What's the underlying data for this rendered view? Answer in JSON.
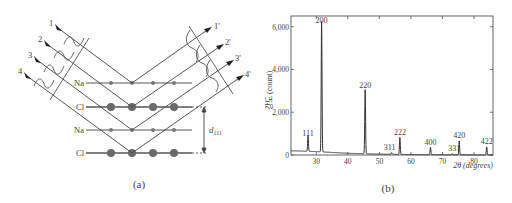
{
  "panel_a": {
    "caption": "(a)",
    "incident_rays": [
      "1",
      "2",
      "3",
      "4"
    ],
    "reflected_rays": [
      "1'",
      "2'",
      "3'",
      "4'"
    ],
    "planes": [
      {
        "label": "Na",
        "atom": "small"
      },
      {
        "label": "Cl",
        "atom": "large"
      },
      {
        "label": "Na",
        "atom": "small"
      },
      {
        "label": "Cl",
        "atom": "large"
      }
    ],
    "spacing_label": "d",
    "spacing_subscript": "111"
  },
  "panel_b": {
    "caption": "(b)",
    "ylabel": "강도 (count)",
    "xlabel": "2θ (degrees)"
  },
  "chart_data": {
    "type": "line",
    "title": "",
    "xlabel": "2θ (degrees)",
    "ylabel": "강도 (count)",
    "xlim": [
      22,
      86
    ],
    "ylim": [
      0,
      6500
    ],
    "xticks": [
      30,
      40,
      50,
      60,
      70,
      80
    ],
    "yticks": [
      0,
      2000,
      4000,
      6000
    ],
    "ytick_labels": [
      "0",
      "2,000",
      "4,000",
      "6,000"
    ],
    "grid": false,
    "series": [
      {
        "name": "NaCl XRD",
        "peaks": [
          {
            "hkl": "111",
            "two_theta": 27.4,
            "intensity": 750
          },
          {
            "hkl": "200",
            "two_theta": 31.7,
            "intensity": 6100
          },
          {
            "hkl": "220",
            "two_theta": 45.5,
            "intensity": 3000
          },
          {
            "hkl": "311",
            "two_theta": 53.9,
            "intensity": 80
          },
          {
            "hkl": "222",
            "two_theta": 56.5,
            "intensity": 800
          },
          {
            "hkl": "400",
            "two_theta": 66.2,
            "intensity": 350
          },
          {
            "hkl": "331",
            "two_theta": 73.1,
            "intensity": 60
          },
          {
            "hkl": "420",
            "two_theta": 75.3,
            "intensity": 650
          },
          {
            "hkl": "422",
            "two_theta": 84.0,
            "intensity": 380
          }
        ],
        "baseline": [
          [
            22,
            200
          ],
          [
            30,
            160
          ],
          [
            40,
            80
          ],
          [
            50,
            40
          ],
          [
            60,
            20
          ],
          [
            70,
            10
          ],
          [
            86,
            0
          ]
        ]
      }
    ]
  }
}
